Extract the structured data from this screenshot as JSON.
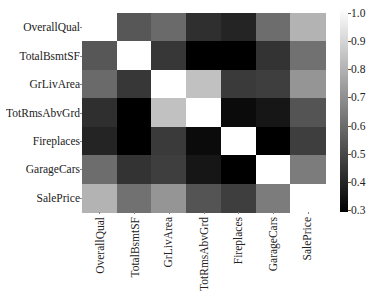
{
  "chart_data": {
    "type": "heatmap",
    "title": "",
    "xlabel": "",
    "ylabel": "",
    "x_labels": [
      "OverallQual",
      "TotalBsmtSF",
      "GrLivArea",
      "TotRmsAbvGrd",
      "Fireplaces",
      "GarageCars",
      "SalePrice"
    ],
    "y_labels": [
      "OverallQual",
      "TotalBsmtSF",
      "GrLivArea",
      "TotRmsAbvGrd",
      "Fireplaces",
      "GarageCars",
      "SalePrice"
    ],
    "values": [
      [
        1.0,
        0.54,
        0.59,
        0.43,
        0.4,
        0.6,
        0.79
      ],
      [
        0.54,
        1.0,
        0.45,
        0.29,
        0.3,
        0.44,
        0.61
      ],
      [
        0.59,
        0.45,
        1.0,
        0.83,
        0.46,
        0.47,
        0.71
      ],
      [
        0.43,
        0.29,
        0.83,
        1.0,
        0.33,
        0.36,
        0.53
      ],
      [
        0.4,
        0.3,
        0.46,
        0.33,
        1.0,
        0.3,
        0.47
      ],
      [
        0.6,
        0.44,
        0.47,
        0.36,
        0.3,
        1.0,
        0.64
      ],
      [
        0.79,
        0.61,
        0.71,
        0.53,
        0.47,
        0.64,
        1.0
      ]
    ],
    "colorbar": {
      "min": 0.3,
      "max": 1.0,
      "ticks": [
        "1.0",
        "0.9",
        "0.8",
        "0.7",
        "0.6",
        "0.5",
        "0.4",
        "0.3"
      ],
      "colormap": "gray",
      "min_color": "#000000",
      "max_color": "#ffffff"
    },
    "grid": false,
    "legend_position": "right"
  }
}
